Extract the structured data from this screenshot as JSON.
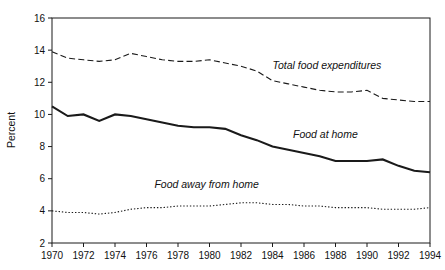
{
  "chart_data": {
    "type": "line",
    "title": "",
    "xlabel": "",
    "ylabel": "Percent",
    "xlim": [
      1970,
      1994
    ],
    "ylim": [
      2,
      16
    ],
    "grid": false,
    "legend_position": "inline-annotations",
    "x": [
      1970,
      1971,
      1972,
      1973,
      1974,
      1975,
      1976,
      1977,
      1978,
      1979,
      1980,
      1981,
      1982,
      1983,
      1984,
      1985,
      1986,
      1987,
      1988,
      1989,
      1990,
      1991,
      1992,
      1993,
      1994
    ],
    "xticks": [
      1970,
      1972,
      1974,
      1976,
      1978,
      1980,
      1982,
      1984,
      1986,
      1988,
      1990,
      1992,
      1994
    ],
    "xtick_labels": [
      "1970",
      "1972",
      "1974",
      "1976",
      "1978",
      "1980",
      "1982",
      "1984",
      "1986",
      "1988",
      "1990",
      "1992",
      "1994"
    ],
    "yticks": [
      2,
      4,
      6,
      8,
      10,
      12,
      14,
      16
    ],
    "ytick_labels": [
      "2",
      "4",
      "6",
      "8",
      "10",
      "12",
      "14",
      "16"
    ],
    "series": [
      {
        "name": "Total food expenditures",
        "style": "dashed",
        "color": "#1a1a1a",
        "values": [
          13.9,
          13.5,
          13.4,
          13.3,
          13.4,
          13.8,
          13.6,
          13.4,
          13.3,
          13.3,
          13.4,
          13.2,
          13.0,
          12.7,
          12.1,
          11.9,
          11.7,
          11.5,
          11.4,
          11.4,
          11.5,
          11.0,
          10.9,
          10.8,
          10.8
        ]
      },
      {
        "name": "Food at home",
        "style": "solid",
        "color": "#1a1a1a",
        "values": [
          10.5,
          9.9,
          10.0,
          9.6,
          10.0,
          9.9,
          9.7,
          9.5,
          9.3,
          9.2,
          9.2,
          9.1,
          8.7,
          8.4,
          8.0,
          7.8,
          7.6,
          7.4,
          7.1,
          7.1,
          7.1,
          7.2,
          6.8,
          6.5,
          6.4
        ]
      },
      {
        "name": "Food away from home",
        "style": "dotted",
        "color": "#1a1a1a",
        "values": [
          4.0,
          3.9,
          3.9,
          3.8,
          3.9,
          4.1,
          4.2,
          4.2,
          4.3,
          4.3,
          4.3,
          4.4,
          4.5,
          4.5,
          4.4,
          4.4,
          4.3,
          4.3,
          4.2,
          4.2,
          4.2,
          4.1,
          4.1,
          4.1,
          4.2
        ]
      }
    ],
    "annotations": [
      {
        "text": "Total food expenditures",
        "x": 1984.0,
        "y": 12.85
      },
      {
        "text": "Food at home",
        "x": 1985.3,
        "y": 8.55
      },
      {
        "text": "Food away from home",
        "x": 1976.5,
        "y": 5.45
      }
    ]
  }
}
